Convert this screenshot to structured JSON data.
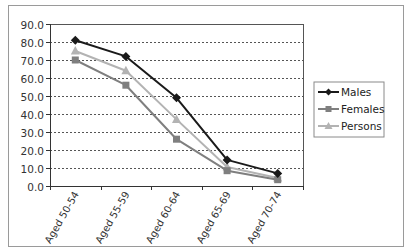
{
  "chart_data": {
    "type": "line",
    "title": "",
    "xlabel": "",
    "ylabel": "",
    "categories": [
      "Aged 50-54",
      "Aged 55-59",
      "Aged 60-64",
      "Aged 65-69",
      "Aged 70-74"
    ],
    "series": [
      {
        "name": "Males",
        "values": [
          81.0,
          72.0,
          49.0,
          14.5,
          7.0
        ],
        "color": "#1a1a1a",
        "marker": "diamond"
      },
      {
        "name": "Females",
        "values": [
          70.0,
          56.0,
          26.0,
          8.5,
          3.5
        ],
        "color": "#7f7f7f",
        "marker": "square"
      },
      {
        "name": "Persons",
        "values": [
          75.0,
          64.0,
          37.0,
          10.5,
          4.5
        ],
        "color": "#b3b3b3",
        "marker": "triangle"
      }
    ],
    "ylim": [
      0,
      90
    ],
    "yticks": [
      "0.0",
      "10.0",
      "20.0",
      "30.0",
      "40.0",
      "50.0",
      "60.0",
      "70.0",
      "80.0",
      "90.0"
    ],
    "grid": true,
    "legend_position": "right"
  },
  "legend": {
    "items": [
      {
        "label": "Males"
      },
      {
        "label": "Females"
      },
      {
        "label": "Persons"
      }
    ]
  }
}
